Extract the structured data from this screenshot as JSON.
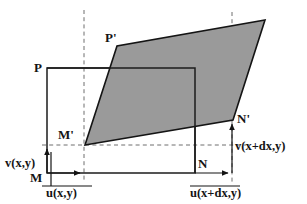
{
  "figure": {
    "canvas": {
      "width": 307,
      "height": 204,
      "background": "#ffffff"
    },
    "colors": {
      "shape_fill": "#9a9a9a",
      "outline": "#141414",
      "rectangle_outline": "#1c1c1c",
      "dashed_guide": "#6f6f6f",
      "label_text": "#141414",
      "background": "#ffffff"
    }
  },
  "labels": {
    "P": "P",
    "P_prime": "P'",
    "M": "M",
    "M_prime": "M'",
    "N": "N",
    "N_prime": "N'",
    "u_xy": "u(x,y)",
    "v_xy": "v(x,y)",
    "u_xdx_y": "u(x+dx,y)",
    "v_xdx_y": "v(x+dx,y)"
  },
  "label_positions": {
    "P": {
      "x": 34,
      "y": 72
    },
    "P_prime": {
      "x": 105,
      "y": 42
    },
    "M": {
      "x": 30,
      "y": 182
    },
    "M_prime": {
      "x": 60,
      "y": 139
    },
    "N": {
      "x": 198,
      "y": 168
    },
    "N_prime": {
      "x": 238,
      "y": 122
    },
    "u_xy": {
      "x": 46,
      "y": 196
    },
    "v_xy": {
      "x": 6,
      "y": 163
    },
    "u_xdx_y": {
      "x": 193,
      "y": 196
    },
    "v_xdx_y": {
      "x": 236,
      "y": 150
    }
  },
  "geometry": {
    "rectangle": {
      "name": "undeformed-element",
      "M": {
        "x": 47,
        "y": 173
      },
      "N": {
        "x": 195,
        "y": 173
      },
      "top_right": {
        "x": 195,
        "y": 68
      },
      "P": {
        "x": 47,
        "y": 68
      },
      "points": "47,173 195,173 195,68 47,68"
    },
    "parallelogram": {
      "name": "deformed-element",
      "M_prime": {
        "x": 85,
        "y": 145
      },
      "N_prime": {
        "x": 233,
        "y": 120
      },
      "top_right": {
        "x": 265,
        "y": 20
      },
      "P_prime": {
        "x": 117,
        "y": 46
      },
      "points": "85,145 233,120 265,20 117,46"
    },
    "dashed_vertical_left": {
      "x": 84,
      "y1": 10,
      "y2": 182
    },
    "dashed_vertical_right": {
      "x": 232,
      "y1": 12,
      "y2": 182
    },
    "dashed_horizontal": {
      "y": 145,
      "x1": 42,
      "x2": 246
    },
    "arrow_u_xy": {
      "x1": 47,
      "y1": 173,
      "x2": 84,
      "y2": 173
    },
    "arrow_v_xy": {
      "x1": 47,
      "y1": 173,
      "x2": 47,
      "y2": 145
    },
    "arrow_u_xdx_y": {
      "x1": 195,
      "y1": 173,
      "x2": 232,
      "y2": 173
    },
    "arrow_v_xdx_y": {
      "x1": 232,
      "y1": 173,
      "x2": 232,
      "y2": 120
    },
    "rule_u_xy": {
      "y": 186,
      "x1": 42,
      "x2": 92
    },
    "rule_v_xy": {
      "x": 51,
      "y1": 152,
      "y2": 186
    },
    "rule_u_xdx_y": {
      "y": 186,
      "x1": 190,
      "x2": 240
    }
  }
}
